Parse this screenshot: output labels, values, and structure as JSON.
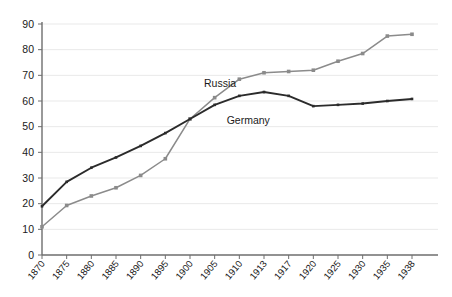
{
  "chart_data": {
    "type": "line",
    "title": "",
    "subtitle": "",
    "xlabel": "",
    "ylabel": "",
    "categories": [
      "1870",
      "1875",
      "1880",
      "1885",
      "1890",
      "1895",
      "1900",
      "1905",
      "1910",
      "1913",
      "1917",
      "1920",
      "1925",
      "1930",
      "1935",
      "1938"
    ],
    "xlim": [
      0,
      15
    ],
    "ylim": [
      0,
      90
    ],
    "yticks": [
      0,
      10,
      20,
      30,
      40,
      50,
      60,
      70,
      80,
      90
    ],
    "grid": true,
    "grid_axis": "y",
    "legend": "inline-annotations",
    "markers": "square",
    "series": [
      {
        "name": "Russia",
        "color": "#8b8b8b",
        "label_x": 8,
        "values": [
          11,
          19.3,
          23,
          26.2,
          31,
          37.5,
          53,
          61.3,
          68.5,
          71,
          71.5,
          72,
          75.5,
          78.5,
          85.3,
          86
        ]
      },
      {
        "name": "Germany",
        "color": "#2b2b2b",
        "label_x": 9,
        "values": [
          19,
          28.5,
          34,
          38,
          42.5,
          47.5,
          53,
          58.5,
          62,
          63.5,
          62,
          58,
          58.5,
          59,
          60,
          60.8
        ]
      }
    ],
    "annotations": [
      {
        "text": "Russia",
        "series": "Russia"
      },
      {
        "text": "Germany",
        "series": "Germany"
      }
    ]
  },
  "axes": {
    "y_tick_labels": [
      "0",
      "10",
      "20",
      "30",
      "40",
      "50",
      "60",
      "70",
      "80",
      "90"
    ],
    "x_tick_labels": [
      "1870",
      "1875",
      "1880",
      "1885",
      "1890",
      "1895",
      "1900",
      "1905",
      "1910",
      "1913",
      "1917",
      "1920",
      "1925",
      "1930",
      "1935",
      "1938"
    ]
  },
  "colors": {
    "background": "#ffffff",
    "axis": "#6e6e6e",
    "grid": "#e9e9e9",
    "russia": "#8b8b8b",
    "germany": "#2b2b2b",
    "text": "#1a1a1a"
  }
}
